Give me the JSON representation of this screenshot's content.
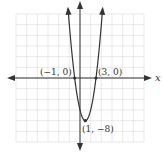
{
  "chart_data": {
    "type": "line",
    "title": "",
    "xlabel": "x",
    "ylabel": "y",
    "function": "y = 2(x + 1)(x - 3)",
    "xlim": [
      -12,
      12
    ],
    "ylim": [
      -12,
      12
    ],
    "grid": true,
    "grid_step": 2,
    "points": [
      {
        "x": -1,
        "y": 0,
        "label": "(−1, 0)"
      },
      {
        "x": 3,
        "y": 0,
        "label": "(3, 0)"
      },
      {
        "x": 1,
        "y": -8,
        "label": "(1, −8)"
      }
    ],
    "series": [
      {
        "name": "parabola",
        "x": [
          -2.16,
          -1,
          0,
          1,
          2,
          3,
          4.16
        ],
        "y": [
          12,
          0,
          -6,
          -8,
          -6,
          0,
          12
        ]
      }
    ]
  },
  "labels": {
    "x_axis": "x",
    "y_axis": "y",
    "p1": "(−1, 0)",
    "p2": "(3, 0)",
    "p3": "(1, −8)"
  },
  "colors": {
    "grid": "#d8d8d8",
    "axis": "#333333",
    "curve": "#333333"
  }
}
